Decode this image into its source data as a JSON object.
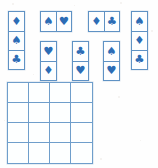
{
  "scene": {
    "title": "Suit tiling puzzle",
    "ink_color": "#2c6cb5",
    "line_color": "#5f92c4",
    "grid_line_color": "#6f9ecb",
    "background_color": "#ffffff",
    "canvas": {
      "width": 158,
      "height": 168
    }
  },
  "glyphs": {
    "spade": "♠",
    "heart": "♥",
    "diamond": "♦",
    "club": "♣"
  },
  "pieces": [
    {
      "id": "piece-1",
      "orientation": "vertical",
      "rows": 3,
      "cols": 1,
      "x": 8,
      "y": 11,
      "suits": [
        "diamond",
        "spade",
        "club"
      ]
    },
    {
      "id": "piece-2",
      "orientation": "horizontal",
      "rows": 1,
      "cols": 2,
      "x": 40,
      "y": 11,
      "suits": [
        "spade",
        "heart"
      ]
    },
    {
      "id": "piece-3",
      "orientation": "horizontal",
      "rows": 1,
      "cols": 2,
      "x": 88,
      "y": 11,
      "suits": [
        "diamond",
        "club"
      ]
    },
    {
      "id": "piece-4",
      "orientation": "vertical",
      "rows": 3,
      "cols": 1,
      "x": 131,
      "y": 11,
      "suits": [
        "spade",
        "diamond",
        "club"
      ]
    },
    {
      "id": "piece-5",
      "orientation": "vertical",
      "rows": 2,
      "cols": 1,
      "x": 40,
      "y": 41,
      "suits": [
        "heart",
        "diamond"
      ]
    },
    {
      "id": "piece-6",
      "orientation": "vertical",
      "rows": 2,
      "cols": 1,
      "x": 72,
      "y": 41,
      "suits": [
        "club",
        "heart"
      ]
    },
    {
      "id": "piece-7",
      "orientation": "vertical",
      "rows": 2,
      "cols": 1,
      "x": 103,
      "y": 41,
      "suits": [
        "spade",
        "heart"
      ]
    }
  ],
  "board": {
    "id": "board-grid",
    "x": 7,
    "y": 82,
    "width": 86,
    "height": 82,
    "rows": 4,
    "cols": 4,
    "cells": [
      [
        "",
        "",
        "",
        ""
      ],
      [
        "",
        "",
        "",
        ""
      ],
      [
        "",
        "",
        "",
        ""
      ],
      [
        "",
        "",
        "",
        ""
      ]
    ]
  },
  "specks": [
    {
      "x": 12,
      "y": 3,
      "size": 2
    },
    {
      "x": 74,
      "y": 5,
      "size": 1
    },
    {
      "x": 120,
      "y": 2,
      "size": 2
    },
    {
      "x": 151,
      "y": 30,
      "size": 2
    },
    {
      "x": 33,
      "y": 74,
      "size": 1
    },
    {
      "x": 118,
      "y": 96,
      "size": 2
    },
    {
      "x": 140,
      "y": 140,
      "size": 1
    },
    {
      "x": 100,
      "y": 158,
      "size": 2
    },
    {
      "x": 4,
      "y": 120,
      "size": 1
    }
  ]
}
